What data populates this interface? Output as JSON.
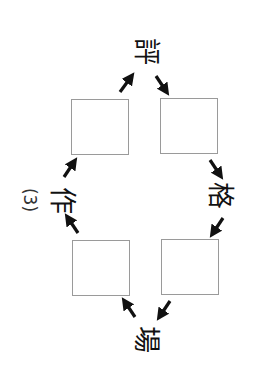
{
  "problem": {
    "label": "(3)",
    "center_shared_character_boxes": 4
  },
  "characters": {
    "top": "評",
    "right": "格",
    "bottom": "場",
    "left": "作"
  },
  "boxes": [
    {
      "position": "top-left",
      "value": ""
    },
    {
      "position": "top-right",
      "value": ""
    },
    {
      "position": "bottom-left",
      "value": ""
    },
    {
      "position": "bottom-right",
      "value": ""
    }
  ],
  "colors": {
    "ink": "#111111",
    "box_border": "#9a9a9a",
    "background": "#ffffff"
  }
}
